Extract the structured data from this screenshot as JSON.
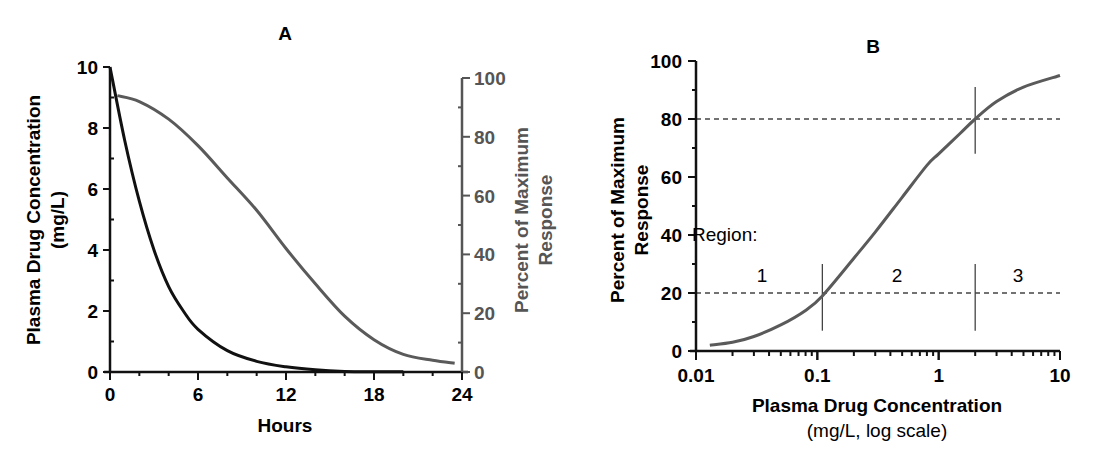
{
  "colors": {
    "concentration": "#111111",
    "response": "#5a5a5a",
    "axis_left": "#111111",
    "axis_right": "#555555",
    "dashed": "#444444"
  },
  "chart_data": [
    {
      "panel": "A",
      "title": "A",
      "type": "line",
      "xlabel": "Hours",
      "ylabel": "Plasma Drug Concentration (mg/L)",
      "ylabel_lines": [
        "Plasma Drug Concentration",
        "(mg/L)"
      ],
      "y2label": "Percent of Maximum Response",
      "y2label_lines": [
        "Percent of Maximum",
        "Response"
      ],
      "xlim": [
        0,
        24
      ],
      "ylim": [
        0,
        10
      ],
      "y2lim": [
        0,
        100
      ],
      "xticks": [
        0,
        6,
        12,
        18,
        24
      ],
      "yticks": [
        0,
        2,
        4,
        6,
        8,
        10
      ],
      "y2ticks": [
        0,
        20,
        40,
        60,
        80,
        100
      ],
      "grid": false,
      "series": [
        {
          "name": "Plasma Drug Concentration",
          "axis": "left",
          "x": [
            0,
            1,
            2,
            3,
            4,
            5,
            6,
            8,
            10,
            12,
            14,
            16,
            18,
            20
          ],
          "values": [
            10,
            7.6,
            5.6,
            4.0,
            2.8,
            2.0,
            1.4,
            0.7,
            0.35,
            0.17,
            0.07,
            0.02,
            0.01,
            0.01
          ]
        },
        {
          "name": "Percent of Maximum Response",
          "axis": "right",
          "x": [
            0.5,
            2,
            4,
            6,
            8,
            10,
            12,
            14,
            16,
            18,
            20,
            22,
            23.5
          ],
          "values": [
            94,
            92,
            86,
            77,
            66,
            55,
            42,
            30,
            19,
            11,
            6,
            4,
            3
          ]
        }
      ]
    },
    {
      "panel": "B",
      "title": "B",
      "type": "line",
      "xlabel": "Plasma Drug Concentration",
      "xlabel_sub": "(mg/L, log scale)",
      "ylabel": "Percent of Maximum Response",
      "ylabel_lines": [
        "Percent of Maximum",
        "Response"
      ],
      "xscale": "log",
      "xlim": [
        0.01,
        10
      ],
      "ylim": [
        0,
        100
      ],
      "xticks": [
        "0.01",
        "0.1",
        "1",
        "10"
      ],
      "yticks": [
        0,
        20,
        40,
        60,
        80,
        100
      ],
      "grid": false,
      "reference_lines": [
        {
          "type": "horizontal",
          "y": 80,
          "style": "dashed"
        },
        {
          "type": "horizontal",
          "y": 20,
          "style": "dashed"
        },
        {
          "type": "vertical",
          "x": 0.11
        },
        {
          "type": "vertical",
          "x": 2.0
        }
      ],
      "annotations": {
        "region_label": "Region:",
        "regions": [
          "1",
          "2",
          "3"
        ]
      },
      "series": [
        {
          "name": "Concentration-response (sigmoid)",
          "x": [
            0.013,
            0.02,
            0.03,
            0.05,
            0.08,
            0.11,
            0.2,
            0.3,
            0.5,
            0.8,
            1.0,
            1.5,
            2.0,
            3.0,
            5.0,
            10.0
          ],
          "values": [
            2,
            3,
            5,
            9,
            14,
            19,
            32,
            41,
            53,
            64,
            68,
            75,
            80,
            86,
            91,
            95
          ]
        }
      ]
    }
  ]
}
